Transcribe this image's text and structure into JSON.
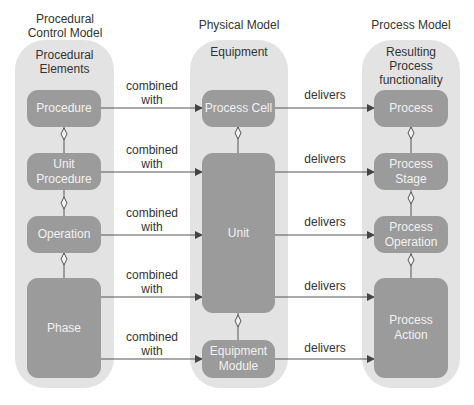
{
  "columns": {
    "left": {
      "title_line1": "Procedural",
      "title_line2": "Control Model",
      "panel_line1": "Procedural",
      "panel_line2": "Elements"
    },
    "middle": {
      "title": "Physical Model",
      "panel_title": "Equipment"
    },
    "right": {
      "title": "Process Model",
      "panel_line1": "Resulting",
      "panel_line2": "Process",
      "panel_line3": "functionality"
    }
  },
  "procedural_elements": [
    {
      "line1": "Procedure",
      "line2": ""
    },
    {
      "line1": "Unit",
      "line2": "Procedure"
    },
    {
      "line1": "Operation",
      "line2": ""
    },
    {
      "line1": "Phase",
      "line2": ""
    }
  ],
  "equipment": [
    {
      "line1": "Process Cell",
      "line2": ""
    },
    {
      "line1": "Unit",
      "line2": ""
    },
    {
      "line1": "Equipment",
      "line2": "Module"
    }
  ],
  "process_functionality": [
    {
      "line1": "Process",
      "line2": ""
    },
    {
      "line1": "Process",
      "line2": "Stage"
    },
    {
      "line1": "Process",
      "line2": "Operation"
    },
    {
      "line1": "Process",
      "line2": "Action"
    }
  ],
  "relations": {
    "combined_line1": "combined",
    "combined_line2": "with",
    "delivers": "delivers"
  },
  "colors": {
    "panel": "#e3e3e3",
    "box": "#9b9b9b",
    "line": "#555555"
  }
}
